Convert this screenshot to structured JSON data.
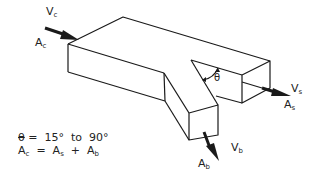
{
  "diagram": {
    "type": "duct-branch-fitting",
    "labels": {
      "upstream_velocity": {
        "main": "V",
        "sub": "c"
      },
      "upstream_area": {
        "main": "A",
        "sub": "c"
      },
      "straight_velocity": {
        "main": "V",
        "sub": "s"
      },
      "straight_area": {
        "main": "A",
        "sub": "s"
      },
      "branch_velocity": {
        "main": "V",
        "sub": "b"
      },
      "branch_area": {
        "main": "A",
        "sub": "b"
      },
      "angle": "θ"
    },
    "notes": {
      "angle_range_symbol": "θ",
      "angle_range_text": " =  15°  to  90°",
      "area_eq_lhs": "A",
      "area_eq_lhs_sub": "c",
      "area_eq_mid": "  =  A",
      "area_eq_mid_sub": "s",
      "area_eq_plus": "  +  A",
      "area_eq_rhs_sub": "b"
    },
    "colors": {
      "line": "#1a1a1a",
      "background": "#ffffff"
    }
  }
}
